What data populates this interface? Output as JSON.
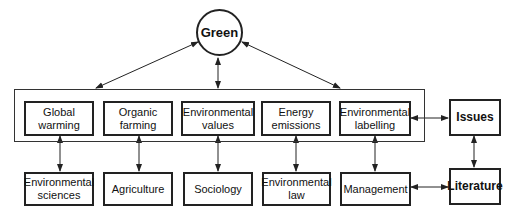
{
  "center": {
    "label": "Green"
  },
  "themes": [
    {
      "label": "Global\nwarming"
    },
    {
      "label": "Organic\nfarming"
    },
    {
      "label": "Environmental\nvalues"
    },
    {
      "label": "Energy\nemissions"
    },
    {
      "label": "Environmental\nlabelling"
    }
  ],
  "disciplines": [
    {
      "label": "Environmental\nsciences"
    },
    {
      "label": "Agriculture"
    },
    {
      "label": "Sociology"
    },
    {
      "label": "Environmental\nlaw"
    },
    {
      "label": "Management"
    }
  ],
  "side": {
    "issues": "Issues",
    "literature": "Literature"
  }
}
